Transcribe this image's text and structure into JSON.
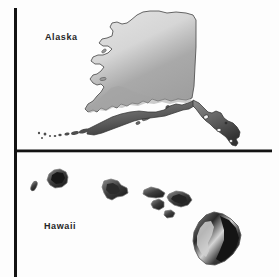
{
  "figure": {
    "name": "alaska-hawaii-inset-map",
    "background_color": "#fdfdfd",
    "width": 279,
    "height": 277
  },
  "panels": [
    {
      "id": "alaska",
      "label": "Alaska",
      "label_x": 45,
      "label_y": 32
    },
    {
      "id": "hawaii",
      "label": "Hawaii",
      "label_x": 44,
      "label_y": 221
    }
  ],
  "frame": {
    "line_color": "#131313",
    "vertical_rule": {
      "x": 14,
      "y1": 8,
      "y2": 277,
      "width": 3
    },
    "horizontal_rule": {
      "y": 150,
      "x1": 14,
      "x2": 272,
      "height": 3
    }
  },
  "palette": {
    "land_light": "#dcdcdc",
    "land_mid": "#b6b6b6",
    "land_dark": "#9c9c9c",
    "coast_dark": "#6e6e6e",
    "island_dark": "#3a3a3a",
    "island_darkest": "#1f1f1f",
    "island_light": "#cfcfcf",
    "outline": "#4a4a4a"
  },
  "alaska": {
    "mainland_name": "alaska-mainland",
    "aleutian_islands_count": 9,
    "panhandle_name": "alaska-panhandle",
    "offshore_islands_count": 5
  },
  "hawaii": {
    "islands": [
      {
        "name": "niihau",
        "cx": 34,
        "cy": 186
      },
      {
        "name": "kauai",
        "cx": 57,
        "cy": 177
      },
      {
        "name": "oahu",
        "cx": 114,
        "cy": 190
      },
      {
        "name": "molokai",
        "cx": 152,
        "cy": 193
      },
      {
        "name": "lanai",
        "cx": 159,
        "cy": 204
      },
      {
        "name": "kahoolawe",
        "cx": 170,
        "cy": 213
      },
      {
        "name": "maui",
        "cx": 180,
        "cy": 199
      },
      {
        "name": "hawaii-big-island",
        "cx": 216,
        "cy": 240
      }
    ]
  }
}
